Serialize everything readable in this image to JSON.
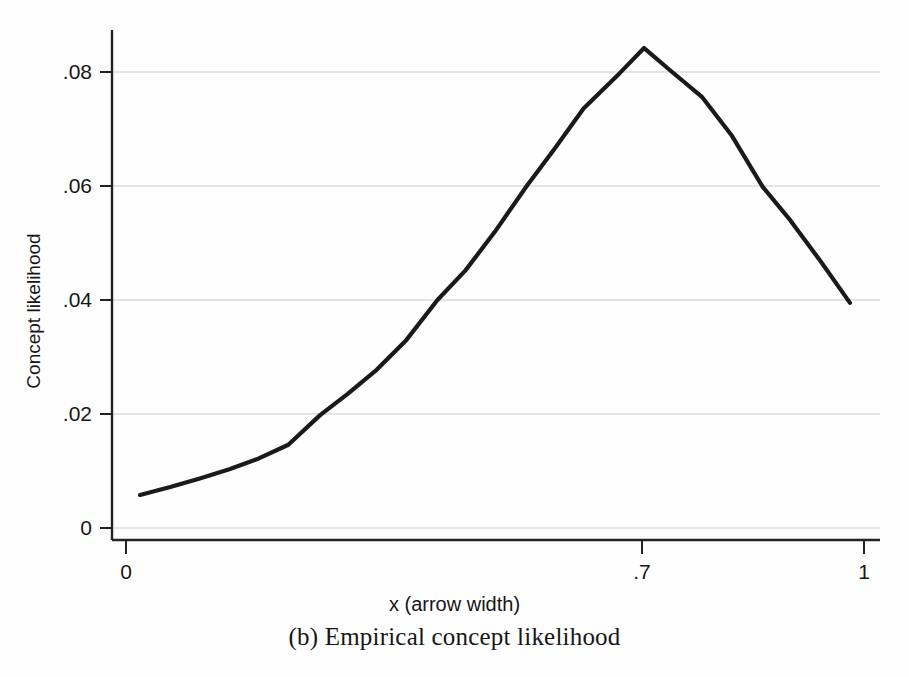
{
  "figure": {
    "caption": "(b) Empirical concept likelihood",
    "background_color": "#fefefe",
    "line_color": "#1a1a1a",
    "grid_color": "#c8c8c8",
    "axis_color": "#1a1a1a"
  },
  "chart_data": {
    "type": "line",
    "title": "",
    "subtitle": "",
    "xlabel": "x (arrow width)",
    "ylabel": "Concept likelihood",
    "xlim": [
      0,
      1
    ],
    "ylim": [
      0,
      0.0875
    ],
    "grid": "horizontal",
    "legend": "none",
    "xticks": [
      0,
      0.7,
      1
    ],
    "xticklabels": [
      "0",
      ".7",
      "1"
    ],
    "yticks": [
      0,
      0.02,
      0.04,
      0.06,
      0.08
    ],
    "yticklabels": [
      "0",
      ".02",
      ".04",
      ".06",
      ".08"
    ],
    "series": [
      {
        "name": "Concept likelihood",
        "x": [
          0.019,
          0.06,
          0.1,
          0.14,
          0.18,
          0.22,
          0.263,
          0.3,
          0.34,
          0.38,
          0.422,
          0.46,
          0.5,
          0.543,
          0.58,
          0.62,
          0.669,
          0.702,
          0.74,
          0.78,
          0.82,
          0.863,
          0.9,
          0.94,
          0.981
        ],
        "y": [
          0.0058,
          0.0072,
          0.0087,
          0.0103,
          0.0122,
          0.0146,
          0.0198,
          0.0235,
          0.0278,
          0.033,
          0.04,
          0.0452,
          0.052,
          0.06,
          0.0664,
          0.0736,
          0.0798,
          0.0842,
          0.08,
          0.0757,
          0.069,
          0.0598,
          0.054,
          0.047,
          0.0395
        ]
      }
    ],
    "annotations": {
      "peak_x": 0.702,
      "peak_y": 0.0842
    }
  },
  "axes": {
    "y_title": "Concept likelihood",
    "x_title": "x (arrow width)",
    "y_tick_labels": [
      {
        "value": 0.08,
        "label": ".08"
      },
      {
        "value": 0.06,
        "label": ".06"
      },
      {
        "value": 0.04,
        "label": ".04"
      },
      {
        "value": 0.02,
        "label": ".02"
      },
      {
        "value": 0,
        "label": "0"
      }
    ],
    "x_tick_labels": [
      {
        "value": 0,
        "label": "0"
      },
      {
        "value": 0.7,
        "label": ".7"
      },
      {
        "value": 1,
        "label": "1"
      }
    ]
  }
}
